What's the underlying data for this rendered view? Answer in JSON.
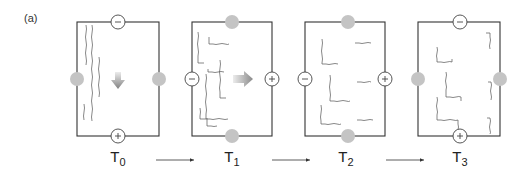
{
  "figure": {
    "label": "(a)",
    "stages": [
      {
        "name": "T",
        "sub": "0",
        "top_terminal": "−",
        "bottom_terminal": "+",
        "left_terminal": "grey",
        "right_terminal": "grey",
        "arrow": "down"
      },
      {
        "name": "T",
        "sub": "1",
        "top_terminal": "grey",
        "bottom_terminal": "grey",
        "left_terminal": "−",
        "right_terminal": "+",
        "arrow": "right"
      },
      {
        "name": "T",
        "sub": "2",
        "top_terminal": "grey",
        "bottom_terminal": "grey",
        "left_terminal": "−",
        "right_terminal": "+",
        "arrow": "none"
      },
      {
        "name": "T",
        "sub": "3",
        "top_terminal": "−",
        "bottom_terminal": "+",
        "left_terminal": "grey",
        "right_terminal": "grey",
        "arrow": "none"
      }
    ],
    "colors": {
      "frame": "#333333",
      "terminal_grey": "#c4c4c4",
      "fiber": "#555555",
      "arrow_gradient_start": "#e8e8e8",
      "arrow_gradient_end": "#8a8a8a"
    }
  }
}
